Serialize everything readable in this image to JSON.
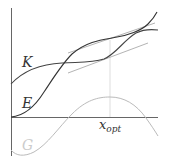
{
  "diagram": {
    "labels": {
      "K": "K",
      "E": "E",
      "G": "G",
      "x_opt_main": "x",
      "x_opt_sub": "opt"
    },
    "colors": {
      "axis": "#555555",
      "K_curve": "#444444",
      "E_curve": "#333333",
      "G_curve": "#bbbbbb",
      "tangent": "#aaaaaa",
      "x_opt_line": "#dddddd"
    }
  }
}
